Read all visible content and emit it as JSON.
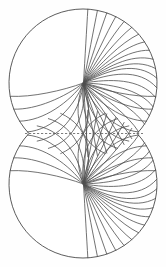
{
  "figure": {
    "background_color": "#fefefe",
    "stroke_color": "#4e4e4e",
    "outline_color": "#4a4a4a",
    "dashed_color": "#5a5a5a",
    "canvas": {
      "width": 166,
      "height": 267
    },
    "lobes": [
      {
        "name": "upper-lobe",
        "center_x": 83,
        "center_y": 83,
        "radius": 74,
        "focus_x": 83.5,
        "focus_y": 83,
        "line_count": 24,
        "orientation": "up"
      },
      {
        "name": "lower-lobe",
        "center_x": 83,
        "center_y": 184,
        "radius": 74,
        "focus_x": 83.5,
        "focus_y": 184,
        "line_count": 24,
        "orientation": "down"
      }
    ],
    "waist": {
      "y": 133.5,
      "left_x": 23,
      "right_x": 144
    },
    "dashed_axis": {
      "y": 133.5,
      "x_start": 25,
      "x_end": 143,
      "dash_pattern": "2.2 1.8"
    }
  },
  "chart_data": {
    "type": "line",
    "xlabel": "",
    "ylabel": "",
    "xlim": [
      0,
      166
    ],
    "ylim": [
      0,
      267
    ],
    "grid": false,
    "legend": "none",
    "annotations": [
      "dashed horizontal symmetry axis at the waist"
    ],
    "series": [
      {
        "name": "upper-lobe-outline",
        "values": []
      },
      {
        "name": "lower-lobe-outline",
        "values": []
      },
      {
        "name": "upper-lobe-flow-lines",
        "values": []
      },
      {
        "name": "lower-lobe-flow-lines",
        "values": []
      },
      {
        "name": "symmetry-axis",
        "values": []
      }
    ]
  }
}
